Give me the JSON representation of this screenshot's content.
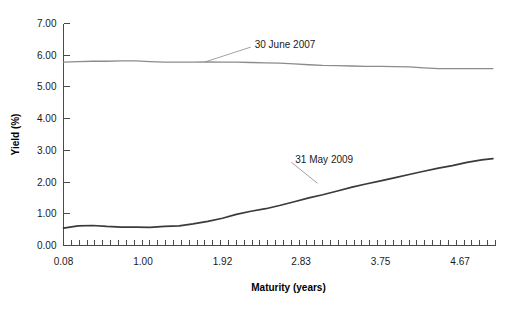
{
  "chart_data": {
    "type": "line",
    "title": "",
    "xlabel": "Maturity (years)",
    "ylabel": "Yield (%)",
    "xlim": [
      0.08,
      5.08
    ],
    "ylim": [
      0.0,
      7.0
    ],
    "grid": false,
    "legend_position": "inline-annotation",
    "x_tick_labels": [
      "0.08",
      "1.00",
      "1.92",
      "2.83",
      "3.75",
      "4.67"
    ],
    "x_tick_values": [
      0.08,
      1.0,
      1.92,
      2.83,
      3.75,
      4.67
    ],
    "x_minor_tick_count": 55,
    "y_tick_labels": [
      "0.00",
      "1.00",
      "2.00",
      "3.00",
      "4.00",
      "5.00",
      "6.00",
      "7.00"
    ],
    "y_tick_values": [
      0.0,
      1.0,
      2.0,
      3.0,
      4.0,
      5.0,
      6.0,
      7.0
    ],
    "series": [
      {
        "name": "30 June 2007",
        "color": "#8c8c8c",
        "annotation": {
          "label": "30 June 2007",
          "label_x": 2.27,
          "label_y": 6.35,
          "point_x": 1.72,
          "point_y": 5.79
        },
        "x": [
          0.08,
          0.25,
          0.42,
          0.58,
          0.75,
          0.92,
          1.08,
          1.25,
          1.42,
          1.58,
          1.75,
          1.92,
          2.08,
          2.25,
          2.42,
          2.58,
          2.75,
          2.92,
          3.08,
          3.25,
          3.42,
          3.58,
          3.75,
          3.92,
          4.08,
          4.25,
          4.42,
          4.58,
          4.75,
          4.92,
          5.05
        ],
        "values": [
          5.78,
          5.8,
          5.81,
          5.81,
          5.82,
          5.82,
          5.8,
          5.78,
          5.78,
          5.78,
          5.79,
          5.78,
          5.78,
          5.77,
          5.76,
          5.75,
          5.73,
          5.7,
          5.68,
          5.67,
          5.66,
          5.65,
          5.65,
          5.64,
          5.63,
          5.6,
          5.58,
          5.58,
          5.58,
          5.58,
          5.58
        ]
      },
      {
        "name": "31 May 2009",
        "color": "#3a3a3a",
        "annotation": {
          "label": "31 May 2009",
          "label_x": 2.74,
          "label_y": 2.72,
          "point_x": 3.02,
          "point_y": 1.96
        },
        "x": [
          0.08,
          0.25,
          0.42,
          0.58,
          0.75,
          0.92,
          1.08,
          1.25,
          1.42,
          1.58,
          1.75,
          1.92,
          2.08,
          2.25,
          2.42,
          2.58,
          2.75,
          2.92,
          3.08,
          3.25,
          3.42,
          3.58,
          3.75,
          3.92,
          4.08,
          4.25,
          4.42,
          4.58,
          4.75,
          4.92,
          5.05
        ],
        "values": [
          0.55,
          0.62,
          0.63,
          0.6,
          0.58,
          0.58,
          0.57,
          0.6,
          0.62,
          0.68,
          0.76,
          0.86,
          0.98,
          1.08,
          1.16,
          1.26,
          1.38,
          1.5,
          1.6,
          1.72,
          1.84,
          1.94,
          2.04,
          2.14,
          2.24,
          2.34,
          2.44,
          2.52,
          2.62,
          2.7,
          2.74
        ]
      }
    ]
  }
}
